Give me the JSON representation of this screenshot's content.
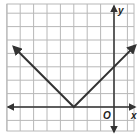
{
  "chart_data": {
    "type": "line",
    "title": "",
    "function": "y = |x + 3|",
    "xlabel": "x",
    "ylabel": "y",
    "origin_label": "O",
    "xlim": [
      -8,
      2
    ],
    "ylim": [
      -1,
      8
    ],
    "grid": true,
    "legend": null,
    "series": [
      {
        "name": "absolute value graph",
        "x": [
          -7.5,
          -3,
          1.6
        ],
        "y": [
          4.5,
          0,
          4.6
        ],
        "vertex": [
          -3,
          0
        ],
        "y_intercept": [
          0,
          3
        ],
        "arrows_both_ends": true
      }
    ]
  },
  "colors": {
    "grid": "#b8b8b8",
    "axis": "#333333",
    "curve": "#333333",
    "background": "#ffffff"
  }
}
